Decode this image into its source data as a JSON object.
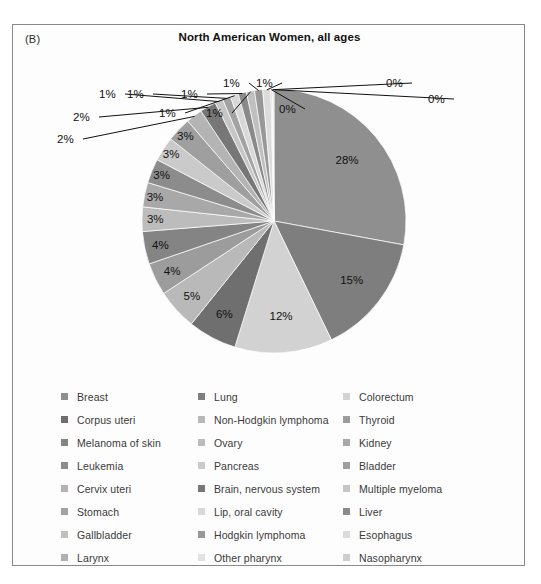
{
  "figure": {
    "panel_label": "(B)",
    "title": "North American Women, all ages"
  },
  "chart_data": {
    "type": "pie",
    "title": "North American Women, all ages",
    "xlabel": "",
    "ylabel": "",
    "units": "percent",
    "legend_position": "bottom",
    "legend_columns": 3,
    "start_angle_deg": 0,
    "direction": "clockwise",
    "categories": [
      "Breast",
      "Lung",
      "Colorectum",
      "Corpus uteri",
      "Non-Hodgkin lymphoma",
      "Thyroid",
      "Melanoma of skin",
      "Ovary",
      "Kidney",
      "Leukemia",
      "Pancreas",
      "Bladder",
      "Cervix uteri",
      "Brain, nervous system",
      "Multiple myeloma",
      "Stomach",
      "Lip, oral cavity",
      "Liver",
      "Gallbladder",
      "Hodgkin lymphoma",
      "Esophagus",
      "Larynx",
      "Other pharynx",
      "Nasopharynx"
    ],
    "values": [
      28,
      15,
      12,
      6,
      5,
      4,
      4,
      3,
      3,
      3,
      3,
      3,
      2,
      2,
      1,
      1,
      1,
      1,
      1,
      1,
      1,
      0,
      0,
      0
    ],
    "labels": [
      "28%",
      "15%",
      "12%",
      "6%",
      "5%",
      "4%",
      "4%",
      "3%",
      "3%",
      "3%",
      "3%",
      "3%",
      "2%",
      "2%",
      "1%",
      "1%",
      "1%",
      "1%",
      "1%",
      "1%",
      "1%",
      "0%",
      "0%",
      "0%"
    ],
    "colors": [
      "#8f8f8f",
      "#7e7e7e",
      "#d2d2d2",
      "#6f6f6f",
      "#b9b9b9",
      "#9c9c9c",
      "#848484",
      "#bcbcbc",
      "#a8a8a8",
      "#8c8c8c",
      "#cacaca",
      "#9f9f9f",
      "#b4b4b4",
      "#777777",
      "#c6c6c6",
      "#a2a2a2",
      "#d8d8d8",
      "#8a8a8a",
      "#c0c0c0",
      "#989898",
      "#dcdcdc",
      "#b0b0b0",
      "#e2e2e2",
      "#cdcdcd"
    ]
  },
  "legend": {
    "columns": [
      {
        "items": [
          {
            "label": "Breast",
            "color": "#8f8f8f"
          },
          {
            "label": "Corpus uteri",
            "color": "#6f6f6f"
          },
          {
            "label": "Melanoma of skin",
            "color": "#848484"
          },
          {
            "label": "Leukemia",
            "color": "#8c8c8c"
          },
          {
            "label": "Cervix uteri",
            "color": "#b4b4b4"
          },
          {
            "label": "Stomach",
            "color": "#a2a2a2"
          },
          {
            "label": "Gallbladder",
            "color": "#c0c0c0"
          },
          {
            "label": "Larynx",
            "color": "#b0b0b0"
          }
        ]
      },
      {
        "items": [
          {
            "label": "Lung",
            "color": "#7e7e7e"
          },
          {
            "label": "Non-Hodgkin lymphoma",
            "color": "#b9b9b9"
          },
          {
            "label": "Ovary",
            "color": "#bcbcbc"
          },
          {
            "label": "Pancreas",
            "color": "#cacaca"
          },
          {
            "label": "Brain, nervous system",
            "color": "#777777"
          },
          {
            "label": "Lip, oral cavity",
            "color": "#d8d8d8"
          },
          {
            "label": "Hodgkin lymphoma",
            "color": "#989898"
          },
          {
            "label": "Other pharynx",
            "color": "#e2e2e2"
          }
        ]
      },
      {
        "items": [
          {
            "label": "Colorectum",
            "color": "#d2d2d2"
          },
          {
            "label": "Thyroid",
            "color": "#9c9c9c"
          },
          {
            "label": "Kidney",
            "color": "#a8a8a8"
          },
          {
            "label": "Bladder",
            "color": "#9f9f9f"
          },
          {
            "label": "Multiple myeloma",
            "color": "#c6c6c6"
          },
          {
            "label": "Liver",
            "color": "#8a8a8a"
          },
          {
            "label": "Esophagus",
            "color": "#dcdcdc"
          },
          {
            "label": "Nasopharynx",
            "color": "#cdcdcd"
          }
        ]
      }
    ]
  }
}
